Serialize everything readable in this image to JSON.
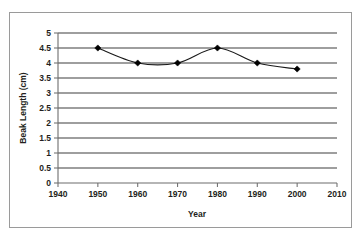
{
  "chart_data": {
    "type": "line",
    "title": "",
    "xlabel": "Year",
    "ylabel": "Beak Length (cm)",
    "x": [
      1950,
      1960,
      1970,
      1980,
      1990,
      2000
    ],
    "values": [
      4.5,
      4.0,
      4.0,
      4.5,
      4.0,
      3.8
    ],
    "series": [
      {
        "name": "Beak Length",
        "values": [
          4.5,
          4.0,
          4.0,
          4.5,
          4.0,
          3.8
        ]
      }
    ],
    "xlim": [
      1940,
      2010
    ],
    "ylim": [
      0,
      5
    ],
    "xticks": [
      1940,
      1950,
      1960,
      1970,
      1980,
      1990,
      2000,
      2010
    ],
    "xtick_labels": [
      "1940",
      "1950",
      "1960",
      "1970",
      "1980",
      "1990",
      "2000",
      "2010"
    ],
    "yticks": [
      0,
      0.5,
      1,
      1.5,
      2,
      2.5,
      3,
      3.5,
      4,
      4.5,
      5
    ],
    "ytick_labels": [
      "0",
      "0.5",
      "1",
      "1.5",
      "2",
      "2.5",
      "3",
      "3.5",
      "4",
      "4.5",
      "5"
    ],
    "grid": "horizontal",
    "legend": "none",
    "marker": "diamond",
    "line_smoothing": true,
    "colors": {
      "line": "#1a1a1a",
      "marker": "#000000",
      "grid": "#3f3f3f",
      "axis": "#6d6d6d",
      "text": "#231f20",
      "frame": "#9a9a9a",
      "background": "#ffffff"
    }
  },
  "axis_titles": {
    "x": "Year",
    "y": "Beak Length (cm)"
  }
}
